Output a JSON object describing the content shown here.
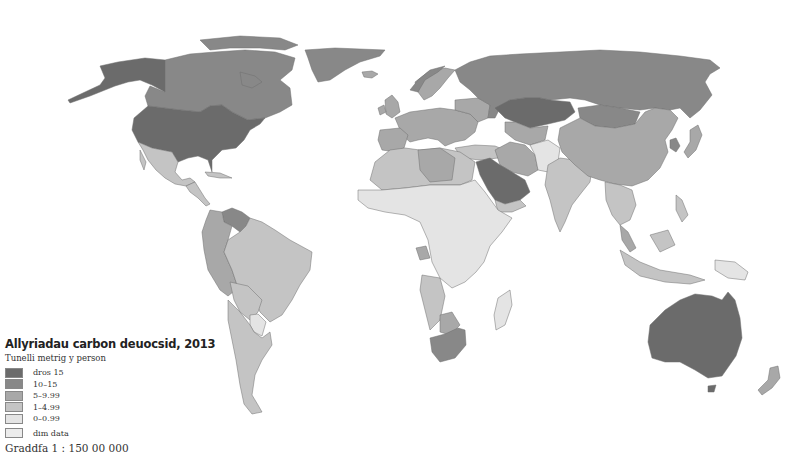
{
  "legend": {
    "title": "Allyriadau carbon deuocsid, 2013",
    "subtitle": "Tunelli metrig y person",
    "items": [
      {
        "label": "dros 15",
        "color": "#6b6b6b"
      },
      {
        "label": "10–15",
        "color": "#888888"
      },
      {
        "label": "5–9.99",
        "color": "#a8a8a8"
      },
      {
        "label": "1–4.99",
        "color": "#c4c4c4"
      },
      {
        "label": "0–0.99",
        "color": "#e4e4e4"
      },
      {
        "label": "dim data",
        "color": "#ececec"
      }
    ]
  },
  "scale": "Graddfa 1 : 150 00 000",
  "colors": {
    "background": "#ffffff",
    "border": "#6f6f6f",
    "over15": "#6b6b6b",
    "c10_15": "#888888",
    "c5_10": "#a8a8a8",
    "c1_5": "#c4c4c4",
    "c0_1": "#e4e4e4",
    "nodata": "#ececec"
  }
}
